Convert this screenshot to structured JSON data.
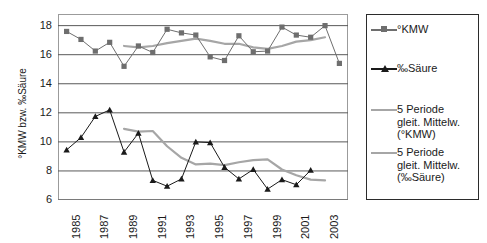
{
  "chart_data": {
    "type": "line",
    "title": "",
    "xlabel": "",
    "ylabel": "°KMW bzw. ‰Säure",
    "ylim": [
      6,
      18.8
    ],
    "ytick_values": [
      6,
      8,
      10,
      12,
      14,
      16,
      18
    ],
    "ytick_labels": [
      "6",
      "8",
      "10",
      "12",
      "14",
      "16",
      "18"
    ],
    "grid": "horizontal",
    "legend_position": "right-outside",
    "x": [
      1985,
      1986,
      1987,
      1988,
      1989,
      1990,
      1991,
      1992,
      1993,
      1994,
      1995,
      1996,
      1997,
      1998,
      1999,
      2000,
      2001,
      2002,
      2003,
      2004
    ],
    "xtick_labels": [
      "1985",
      "1987",
      "1989",
      "1991",
      "1993",
      "1995",
      "1997",
      "1999",
      "2001",
      "2003"
    ],
    "xtick_values": [
      1985,
      1987,
      1989,
      1991,
      1993,
      1995,
      1997,
      1999,
      2001,
      2003
    ],
    "xlim": [
      1984.4,
      2004.6
    ],
    "series": [
      {
        "name": "°KMW",
        "marker": "square",
        "color": "#6e6e6e",
        "values": [
          17.6,
          17.05,
          16.25,
          16.85,
          15.2,
          16.6,
          16.15,
          17.75,
          17.5,
          17.35,
          15.85,
          15.6,
          17.3,
          16.2,
          16.25,
          17.9,
          17.35,
          17.2,
          18.0,
          15.4
        ]
      },
      {
        "name": "‰Säure",
        "marker": "triangle",
        "color": "#1a1a1a",
        "values": [
          9.45,
          10.3,
          11.75,
          12.2,
          9.3,
          10.6,
          7.35,
          6.95,
          7.45,
          10.0,
          9.95,
          8.25,
          7.45,
          8.1,
          6.75,
          7.4,
          7.05,
          8.05,
          null,
          null
        ],
        "note": "last plotted point at 2003 = 8.05"
      },
      {
        "name": "5 Periode gleit. Mittelw. (°KMW)",
        "marker": "none",
        "color": "#a6a6a6",
        "values": [
          null,
          null,
          null,
          null,
          16.6,
          16.5,
          16.6,
          16.8,
          16.95,
          17.1,
          16.95,
          16.75,
          16.75,
          16.5,
          16.4,
          16.6,
          16.9,
          17.0,
          17.2,
          null
        ]
      },
      {
        "name": "5 Periode gleit. Mittelw. (‰Säure)",
        "marker": "none",
        "color": "#a6a6a6",
        "values": [
          null,
          null,
          null,
          null,
          10.9,
          10.7,
          10.75,
          9.7,
          8.9,
          8.45,
          8.5,
          8.4,
          8.6,
          8.75,
          8.8,
          8.1,
          7.7,
          7.4,
          7.35,
          null
        ]
      }
    ]
  },
  "axis": {
    "y_title": "°KMW bzw. ‰Säure"
  },
  "legend": {
    "items": [
      {
        "label": "°KMW",
        "key": "line-square-marker",
        "color": "#6e6e6e"
      },
      {
        "label": "‰Säure",
        "key": "line-triangle-marker",
        "color": "#1a1a1a"
      },
      {
        "label": "5 Periode\ngleit. Mittelw.\n(°KMW)",
        "key": "line-plain",
        "color": "#a6a6a6"
      },
      {
        "label": "5 Periode\ngleit. Mittelw.\n(‰Säure)",
        "key": "line-plain",
        "color": "#a6a6a6"
      }
    ]
  }
}
